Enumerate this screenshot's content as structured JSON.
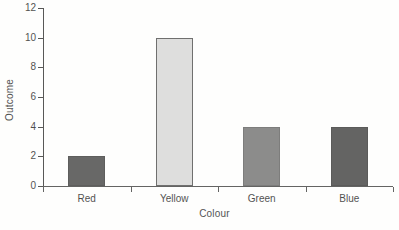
{
  "chart_data": {
    "type": "bar",
    "title": "",
    "xlabel": "Colour",
    "ylabel": "Outcome",
    "categories": [
      "Red",
      "Yellow",
      "Green",
      "Blue"
    ],
    "values": [
      2,
      10,
      4,
      4
    ],
    "series": [
      {
        "name": "Outcome",
        "values": [
          2,
          10,
          4,
          4
        ]
      }
    ],
    "ylim": [
      0,
      12
    ],
    "ytick_labels": [
      "0",
      "2",
      "4",
      "6",
      "8",
      "10",
      "12"
    ],
    "ytick_values": [
      0,
      2,
      4,
      6,
      8,
      10,
      12
    ],
    "grid": false,
    "legend": false,
    "legend_position": "none",
    "bar_colors": [
      "#3f3f3f",
      "#d7d7d7",
      "#6e6e6e",
      "#3a3a3a"
    ],
    "bar_border_colors": [
      "#333333",
      "#4a4a4a",
      "#5a5a5a",
      "#2f2f2f"
    ],
    "axis_color": "#2b2b2b",
    "background_color": "#ffffff",
    "text_color": "#1c1c1c"
  },
  "axes": {
    "y_title": "Outcome",
    "x_title": "Colour"
  }
}
